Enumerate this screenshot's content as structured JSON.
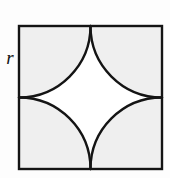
{
  "figure": {
    "kind": "geometry-diagram",
    "label_r": "r",
    "colors": {
      "background": "#fdfdfd",
      "stroke": "#141414",
      "shaded_corner_fill": "#efefef",
      "center_star_fill": "#ffffff"
    },
    "geometry": {
      "square_left": 19,
      "square_top": 26,
      "square_size": 143,
      "arc_radius": 71.5,
      "stroke_width": 2.4,
      "arc_count": 4,
      "arc_centers": [
        "top-left",
        "top-right",
        "bottom-right",
        "bottom-left"
      ],
      "midpoint_top": [
        90.5,
        26
      ],
      "midpoint_right": [
        162,
        97.5
      ],
      "midpoint_bottom": [
        90.5,
        169
      ],
      "midpoint_left": [
        19,
        97.5
      ]
    }
  }
}
